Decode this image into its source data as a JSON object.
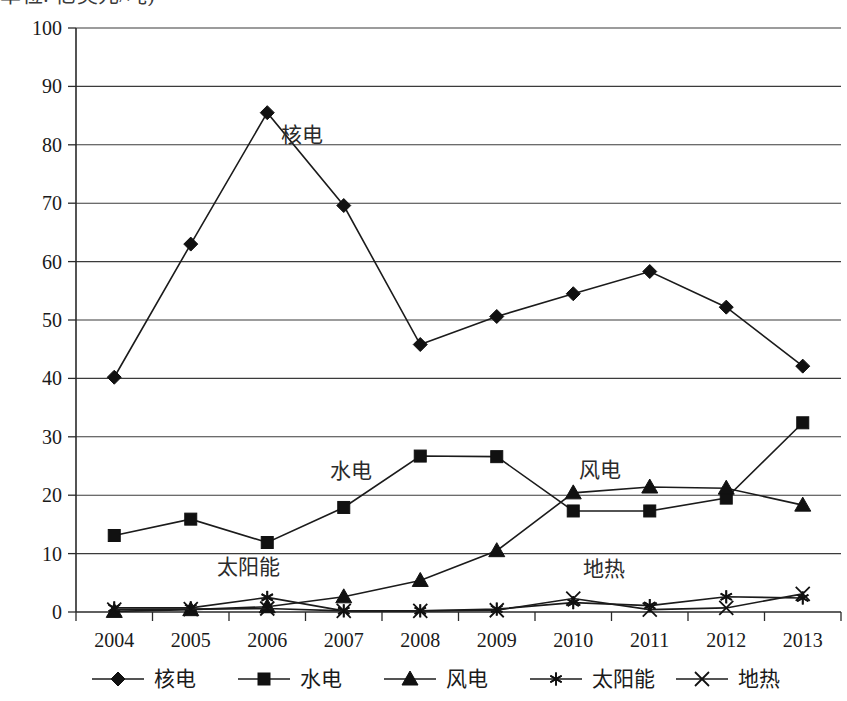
{
  "title_clipped": "单位: 亿美元/吨)",
  "chart_data": {
    "type": "line",
    "title": "",
    "subtitle": "",
    "xlabel": "",
    "ylabel": "",
    "categories": [
      "2004",
      "2005",
      "2006",
      "2007",
      "2008",
      "2009",
      "2010",
      "2011",
      "2012",
      "2013"
    ],
    "x": [
      2004,
      2005,
      2006,
      2007,
      2008,
      2009,
      2010,
      2011,
      2012,
      2013
    ],
    "ylim": [
      0,
      100
    ],
    "yticks": [
      0,
      10,
      20,
      30,
      40,
      50,
      60,
      70,
      80,
      90,
      100
    ],
    "grid": true,
    "grid_axis": "y",
    "legend_position": "bottom",
    "series": [
      {
        "name": "核电",
        "marker": "diamond",
        "values": [
          40.2,
          63.0,
          85.5,
          69.6,
          45.8,
          50.6,
          54.5,
          58.3,
          52.2,
          42.1
        ]
      },
      {
        "name": "水电",
        "marker": "square",
        "values": [
          13.1,
          15.9,
          11.9,
          17.9,
          26.7,
          26.6,
          17.3,
          17.3,
          19.5,
          32.4
        ]
      },
      {
        "name": "风电",
        "marker": "triangle",
        "values": [
          0.1,
          0.4,
          0.9,
          2.6,
          5.4,
          10.5,
          20.4,
          21.4,
          21.2,
          18.3
        ]
      },
      {
        "name": "太阳能",
        "marker": "asterisk",
        "values": [
          0.7,
          0.7,
          2.5,
          0.2,
          0.2,
          0.5,
          1.6,
          1.1,
          2.6,
          2.4
        ]
      },
      {
        "name": "地热",
        "marker": "cross",
        "values": [
          0.4,
          0.5,
          0.6,
          0.2,
          0.2,
          0.3,
          2.3,
          0.4,
          0.7,
          3.1
        ]
      }
    ],
    "inline_annotations": [
      {
        "text": "核电",
        "x": 2006.45,
        "y": 80.5
      },
      {
        "text": "水电",
        "x": 2007.1,
        "y": 23.0
      },
      {
        "text": "风电",
        "x": 2010.35,
        "y": 23.2
      },
      {
        "text": "太阳能",
        "x": 2005.75,
        "y": 6.5
      },
      {
        "text": "地热",
        "x": 2010.4,
        "y": 6.2
      }
    ]
  },
  "legend": {
    "items": [
      {
        "label": "核电",
        "marker": "diamond"
      },
      {
        "label": "水电",
        "marker": "square"
      },
      {
        "label": "风电",
        "marker": "triangle"
      },
      {
        "label": "太阳能",
        "marker": "asterisk"
      },
      {
        "label": "地热",
        "marker": "cross"
      }
    ]
  },
  "colors": {
    "ink": "#111111",
    "grid": "#3b3b3b",
    "background": "#ffffff"
  }
}
